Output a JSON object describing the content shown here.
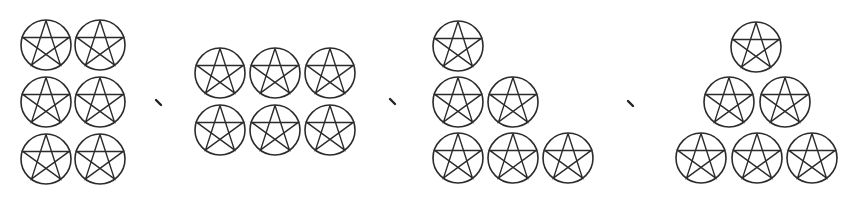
{
  "figure": {
    "width": 859,
    "height": 203,
    "background": "#ffffff",
    "stroke_color": "#2b2b2b",
    "icon": "pentagram-in-circle-icon",
    "radius": 25,
    "separator_glyph": "、",
    "groups": [
      {
        "name": "group-2x3-grid",
        "count": 6,
        "layout": "2 columns x 3 rows",
        "centers": [
          [
            46,
            45
          ],
          [
            100,
            45
          ],
          [
            46,
            102
          ],
          [
            100,
            102
          ],
          [
            46,
            159
          ],
          [
            100,
            159
          ]
        ]
      },
      {
        "name": "group-3x2-grid",
        "count": 6,
        "layout": "3 columns x 2 rows",
        "centers": [
          [
            220,
            73
          ],
          [
            275,
            73
          ],
          [
            330,
            73
          ],
          [
            220,
            130
          ],
          [
            275,
            130
          ],
          [
            330,
            130
          ]
        ]
      },
      {
        "name": "group-staircase",
        "count": 6,
        "layout": "rows of 1, 2, 3 left-aligned",
        "centers": [
          [
            458,
            46
          ],
          [
            458,
            102
          ],
          [
            513,
            102
          ],
          [
            458,
            158
          ],
          [
            513,
            158
          ],
          [
            568,
            158
          ]
        ]
      },
      {
        "name": "group-pyramid",
        "count": 6,
        "layout": "rows of 1, 2, 3 centered",
        "centers": [
          [
            756,
            47
          ],
          [
            729,
            102
          ],
          [
            785,
            102
          ],
          [
            701,
            158
          ],
          [
            757,
            158
          ],
          [
            812,
            158
          ]
        ]
      }
    ],
    "separators": [
      {
        "x": 158,
        "y": 103
      },
      {
        "x": 392,
        "y": 102
      },
      {
        "x": 630,
        "y": 104
      }
    ]
  }
}
